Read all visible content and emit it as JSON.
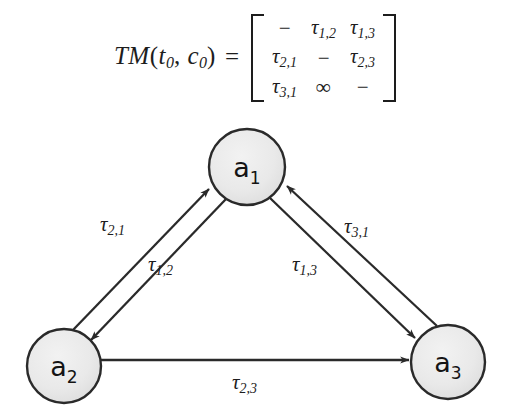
{
  "equation": {
    "lhs": "TM",
    "lhs_args": [
      "t",
      "c"
    ],
    "lhs_arg_subs": [
      "0",
      "0"
    ],
    "lhs_full": "TM(t0, c0)",
    "equals": "=",
    "matrix": {
      "rows": [
        [
          "−",
          "τ1,2",
          "τ1,3"
        ],
        [
          "τ2,1",
          "−",
          "τ2,3"
        ],
        [
          "τ3,1",
          "∞",
          "−"
        ]
      ],
      "cells": [
        [
          {
            "type": "dash",
            "text": "−"
          },
          {
            "type": "tau",
            "base": "τ",
            "sub": "1,2"
          },
          {
            "type": "tau",
            "base": "τ",
            "sub": "1,3"
          }
        ],
        [
          {
            "type": "tau",
            "base": "τ",
            "sub": "2,1"
          },
          {
            "type": "dash",
            "text": "−"
          },
          {
            "type": "tau",
            "base": "τ",
            "sub": "2,3"
          }
        ],
        [
          {
            "type": "tau",
            "base": "τ",
            "sub": "3,1"
          },
          {
            "type": "infinity",
            "text": "∞"
          },
          {
            "type": "dash",
            "text": "−"
          }
        ]
      ]
    }
  },
  "graph": {
    "type": "directed-graph",
    "nodes": [
      {
        "id": "a1",
        "base": "a",
        "sub": "1",
        "cx": 247,
        "cy": 55,
        "r": 38
      },
      {
        "id": "a2",
        "base": "a",
        "sub": "2",
        "cx": 64,
        "cy": 254,
        "r": 37
      },
      {
        "id": "a3",
        "base": "a",
        "sub": "3",
        "cx": 448,
        "cy": 250,
        "r": 37
      }
    ],
    "edges": [
      {
        "id": "e21",
        "from": "a2",
        "to": "a1",
        "base": "τ",
        "sub": "2,1",
        "label_x": 100,
        "label_y": 100
      },
      {
        "id": "e12",
        "from": "a1",
        "to": "a2",
        "base": "τ",
        "sub": "1,2",
        "label_x": 148,
        "label_y": 140
      },
      {
        "id": "e13",
        "from": "a1",
        "to": "a3",
        "base": "τ",
        "sub": "1,3",
        "label_x": 292,
        "label_y": 140
      },
      {
        "id": "e31",
        "from": "a3",
        "to": "a1",
        "base": "τ",
        "sub": "3,1",
        "label_x": 344,
        "label_y": 102
      },
      {
        "id": "e23",
        "from": "a2",
        "to": "a3",
        "base": "τ",
        "sub": "2,3",
        "label_x": 232,
        "label_y": 258
      }
    ]
  },
  "colors": {
    "node_fill": "#e9e9e9",
    "node_stroke": "#2a2a2a",
    "edge_stroke": "#2a2a2a",
    "text": "#1d1d1d",
    "background": "#ffffff"
  }
}
